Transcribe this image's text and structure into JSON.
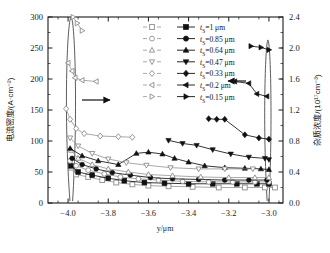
{
  "chart_data": {
    "type": "line",
    "title": "",
    "xlabel": "y/μm",
    "ylabel_left": "电流密度/(A·cm⁻²)",
    "ylabel_right": "杂质浓度/(10¹⁷cm⁻³)",
    "xlim": [
      -4.1,
      -2.93
    ],
    "ylim_left": [
      0,
      300
    ],
    "ylim_right": [
      0.0,
      2.4
    ],
    "xticks": [
      -4.0,
      -3.8,
      -3.6,
      -3.4,
      -3.2,
      -3.0
    ],
    "xticklabels": [
      "−4.0",
      "−3.8",
      "−3.6",
      "−3.4",
      "−3.2",
      "−3.0"
    ],
    "yticks_left": [
      0,
      50,
      100,
      150,
      200,
      250,
      300
    ],
    "yticklabels_left": [
      "0",
      "50",
      "100",
      "150",
      "200",
      "250",
      "300"
    ],
    "yticks_right": [
      0.0,
      0.4,
      0.8,
      1.2,
      1.6,
      2.0,
      2.4
    ],
    "yticklabels_right": [
      "0.0",
      "0.4",
      "0.8",
      "1.2",
      "1.6",
      "2.0",
      "2.4"
    ],
    "grid": false,
    "legend_position": "upper-right-inside",
    "left_axis_arrow": "right-arrow pointing from curves to left axis",
    "right_axis_arrow": "left-arrow pointing from legend to right axis",
    "series": [
      {
        "name": "t_S=1 μm",
        "label_prefix": "t",
        "label_sub": "S",
        "label_value": "=1 μm",
        "marker_open": "square",
        "marker_filled": "square",
        "axis": "left",
        "open_points": [
          [
            -3.985,
            57
          ],
          [
            -3.96,
            46
          ],
          [
            -3.9,
            42
          ],
          [
            -3.83,
            37
          ],
          [
            -3.76,
            33
          ],
          [
            -3.68,
            30
          ],
          [
            -3.6,
            28
          ],
          [
            -3.5,
            27
          ],
          [
            -3.38,
            26
          ],
          [
            -3.25,
            25
          ],
          [
            -3.12,
            25
          ],
          [
            -3.02,
            25
          ],
          [
            -2.97,
            25
          ]
        ],
        "filled_points": [
          [
            -3.985,
            60
          ],
          [
            -3.95,
            50
          ],
          [
            -3.88,
            45
          ],
          [
            -3.8,
            40
          ],
          [
            -3.72,
            36
          ],
          [
            -3.62,
            33
          ],
          [
            -3.52,
            32
          ],
          [
            -3.4,
            31
          ],
          [
            -3.28,
            31
          ],
          [
            -3.16,
            31
          ],
          [
            -3.06,
            31
          ],
          [
            -3.0,
            31
          ]
        ]
      },
      {
        "name": "t_S=0.85 μm",
        "label_prefix": "t",
        "label_sub": "S",
        "label_value": "=0.85 μm",
        "marker_open": "circle",
        "marker_filled": "circle",
        "axis": "left",
        "open_points": [
          [
            -3.99,
            68
          ],
          [
            -3.96,
            60
          ],
          [
            -3.9,
            53
          ],
          [
            -3.82,
            47
          ],
          [
            -3.74,
            42
          ],
          [
            -3.65,
            39
          ],
          [
            -3.55,
            37
          ],
          [
            -3.43,
            35
          ],
          [
            -3.3,
            34
          ],
          [
            -3.18,
            34
          ],
          [
            -3.07,
            34
          ],
          [
            -3.0,
            34
          ]
        ],
        "filled_points": [
          [
            -3.98,
            72
          ],
          [
            -3.93,
            62
          ],
          [
            -3.86,
            55
          ],
          [
            -3.78,
            49
          ],
          [
            -3.69,
            45
          ],
          [
            -3.59,
            41
          ],
          [
            -3.48,
            39
          ],
          [
            -3.35,
            38
          ],
          [
            -3.22,
            37
          ],
          [
            -3.1,
            37
          ],
          [
            -3.01,
            37
          ]
        ]
      },
      {
        "name": "t_S=0.64 μm",
        "label_prefix": "t",
        "label_sub": "S",
        "label_value": "=0.64 μm",
        "marker_open": "triangle-up",
        "marker_filled": "triangle-up",
        "axis": "left",
        "open_points": [
          [
            -3.985,
            85
          ],
          [
            -3.95,
            72
          ],
          [
            -3.88,
            62
          ],
          [
            -3.8,
            55
          ],
          [
            -3.7,
            50
          ],
          [
            -3.6,
            46
          ],
          [
            -3.48,
            44
          ],
          [
            -3.34,
            42
          ],
          [
            -3.2,
            41
          ],
          [
            -3.07,
            41
          ],
          [
            -3.0,
            41
          ]
        ],
        "filled_points": [
          [
            -3.99,
            88
          ],
          [
            -3.93,
            76
          ],
          [
            -3.85,
            68
          ],
          [
            -3.75,
            62
          ],
          [
            -3.66,
            80
          ],
          [
            -3.6,
            82
          ],
          [
            -3.53,
            79
          ],
          [
            -3.47,
            72
          ],
          [
            -3.4,
            66
          ],
          [
            -3.32,
            60
          ],
          [
            -3.22,
            57
          ],
          [
            -3.12,
            56
          ],
          [
            -3.04,
            55
          ],
          [
            -3.0,
            54
          ]
        ]
      },
      {
        "name": "t_S=0.47 μm",
        "label_prefix": "t",
        "label_sub": "S",
        "label_value": "=0.47 μm",
        "marker_open": "triangle-down",
        "marker_filled": "triangle-down",
        "axis": "left",
        "open_points": [
          [
            -3.99,
            105
          ],
          [
            -3.95,
            92
          ],
          [
            -3.88,
            80
          ],
          [
            -3.8,
            71
          ],
          [
            -3.71,
            65
          ],
          [
            -3.61,
            61
          ],
          [
            -3.49,
            57
          ],
          [
            -3.35,
            55
          ],
          [
            -3.22,
            55
          ],
          [
            -3.08,
            55
          ]
        ],
        "filled_points": [
          [
            -3.5,
            101
          ],
          [
            -3.43,
            96
          ],
          [
            -3.36,
            93
          ],
          [
            -3.28,
            86
          ],
          [
            -3.19,
            79
          ],
          [
            -3.1,
            74
          ],
          [
            -3.02,
            72
          ],
          [
            -3.0,
            70
          ]
        ]
      },
      {
        "name": "t_S=0.33 μm",
        "label_prefix": "t",
        "label_sub": "S",
        "label_value": "=0.33 μm",
        "marker_open": "diamond",
        "marker_filled": "diamond",
        "axis": "left",
        "open_points": [
          [
            -4.01,
            152
          ],
          [
            -3.99,
            135
          ],
          [
            -3.96,
            120
          ],
          [
            -3.92,
            112
          ],
          [
            -3.84,
            108
          ],
          [
            -3.75,
            107
          ],
          [
            -3.68,
            106
          ]
        ],
        "filled_points": [
          [
            -3.3,
            136
          ],
          [
            -3.26,
            135
          ],
          [
            -3.22,
            135
          ],
          [
            -3.12,
            110
          ],
          [
            -3.05,
            105
          ],
          [
            -3.0,
            103
          ]
        ]
      },
      {
        "name": "t_S=0.2 μm",
        "label_prefix": "t",
        "label_sub": "S",
        "label_value": "=0.2 μm",
        "marker_open": "triangle-left",
        "marker_filled": "triangle-left",
        "axis": "left",
        "open_points": [
          [
            -4.0,
            226
          ],
          [
            -3.98,
            213
          ],
          [
            -3.965,
            202
          ],
          [
            -3.93,
            198
          ],
          [
            -3.86,
            196
          ]
        ],
        "filled_points": [
          [
            -3.17,
            196
          ],
          [
            -3.1,
            193
          ],
          [
            -3.06,
            176
          ],
          [
            -3.01,
            172
          ]
        ]
      },
      {
        "name": "t_S=0.15 μm",
        "label_prefix": "t",
        "label_sub": "S",
        "label_value": "=0.15 μm",
        "marker_open": "triangle-right",
        "marker_filled": "triangle-right",
        "axis": "left",
        "open_points": [
          [
            -3.975,
            300
          ],
          [
            -3.955,
            290
          ],
          [
            -3.93,
            278
          ]
        ],
        "filled_points": [
          [
            -3.09,
            253
          ],
          [
            -3.04,
            251
          ],
          [
            -3.0,
            247
          ]
        ]
      }
    ],
    "doping_profile_left": {
      "description": "narrow tall doping spike / ellipse near y = -4.0",
      "peak_x": -3.985,
      "peak_value_left_axis": 300
    },
    "doping_profile_right": {
      "description": "narrow tall doping spike / ellipse near y = -3.0",
      "peak_x": -3.005,
      "peak_value_left_axis": 263
    }
  },
  "legend": {
    "entries": [
      {
        "open": "square",
        "filled": "square",
        "text_prefix": "t",
        "text_sub": "S",
        "text": "=1 μm"
      },
      {
        "open": "circle",
        "filled": "circle",
        "text_prefix": "t",
        "text_sub": "S",
        "text": "=0.85 μm"
      },
      {
        "open": "triangle-up",
        "filled": "triangle-up",
        "text_prefix": "t",
        "text_sub": "S",
        "text": "=0.64 μm"
      },
      {
        "open": "triangle-down",
        "filled": "triangle-down",
        "text_prefix": "t",
        "text_sub": "S",
        "text": "=0.47 μm"
      },
      {
        "open": "diamond",
        "filled": "diamond",
        "text_prefix": "t",
        "text_sub": "S",
        "text": "=0.33 μm"
      },
      {
        "open": "triangle-left",
        "filled": "triangle-left",
        "text_prefix": "t",
        "text_sub": "S",
        "text": "=0.2 μm"
      },
      {
        "open": "triangle-right",
        "filled": "triangle-right",
        "text_prefix": "t",
        "text_sub": "S",
        "text": "=0.15 μm"
      }
    ]
  },
  "colors": {
    "axis": "#1a1a1a",
    "open_series": "#8c8c8c",
    "filled_series": "#111111",
    "background": "#ffffff"
  }
}
